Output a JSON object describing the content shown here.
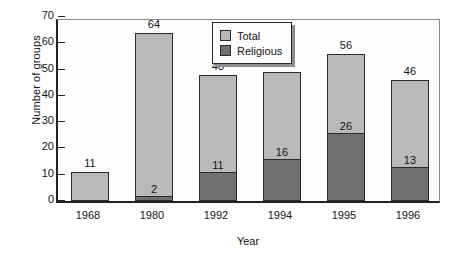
{
  "chart_data": {
    "type": "bar",
    "stacked": true,
    "title": "",
    "xlabel": "Year",
    "ylabel": "Number of groups",
    "categories": [
      "1968",
      "1980",
      "1992",
      "1994",
      "1995",
      "1996"
    ],
    "ylim": [
      0,
      70
    ],
    "yticks": [
      0,
      10,
      20,
      30,
      40,
      50,
      60,
      70
    ],
    "ytick_labels": [
      "0",
      "10",
      "20",
      "30",
      "40",
      "50",
      "60",
      "70"
    ],
    "grid": false,
    "legend_position": "top-center",
    "series": [
      {
        "name": "Total",
        "color": "#b9b9b9",
        "values": [
          11,
          64,
          48,
          49,
          56,
          46
        ],
        "labels": [
          "11",
          "64",
          "48",
          "49",
          "56",
          "46"
        ]
      },
      {
        "name": "Religious",
        "color": "#707070",
        "values": [
          0,
          2,
          11,
          16,
          26,
          13
        ],
        "labels": [
          "",
          "2",
          "11",
          "16",
          "26",
          "13"
        ]
      }
    ],
    "legend": [
      {
        "label": "Total",
        "color": "#b9b9b9"
      },
      {
        "label": "Religious",
        "color": "#707070"
      }
    ]
  }
}
